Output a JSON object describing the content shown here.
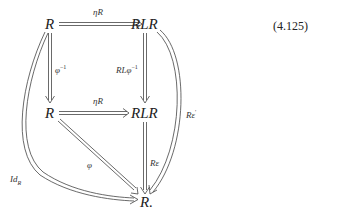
{
  "equation_number": "(4.125)",
  "nodes": {
    "top_left": "R",
    "top_right": "RLR",
    "mid_left": "R",
    "mid_right": "RLR",
    "bottom": "R."
  },
  "arrows": {
    "top_horizontal": {
      "label": "ηR",
      "from": "top_left",
      "to": "top_right"
    },
    "left_vertical": {
      "label": "φ",
      "label_sup": "−1",
      "from": "top_left",
      "to": "mid_left"
    },
    "right_vertical": {
      "label": "RLφ",
      "label_sup": "−1",
      "from": "top_right",
      "to": "mid_right"
    },
    "mid_horizontal": {
      "label": "ηR",
      "from": "mid_left",
      "to": "mid_right"
    },
    "diagonal": {
      "label": "φ",
      "from": "mid_left",
      "to": "bottom"
    },
    "lower_vertical": {
      "label": "Rε",
      "from": "mid_right",
      "to": "bottom"
    },
    "left_curve": {
      "label": "Id",
      "label_sub": "R",
      "from": "top_left",
      "to": "bottom"
    },
    "right_curve": {
      "label": "Rε",
      "label_sup": "′",
      "from": "top_right",
      "to": "bottom"
    }
  },
  "arrow_style": "double (natural transformation)"
}
